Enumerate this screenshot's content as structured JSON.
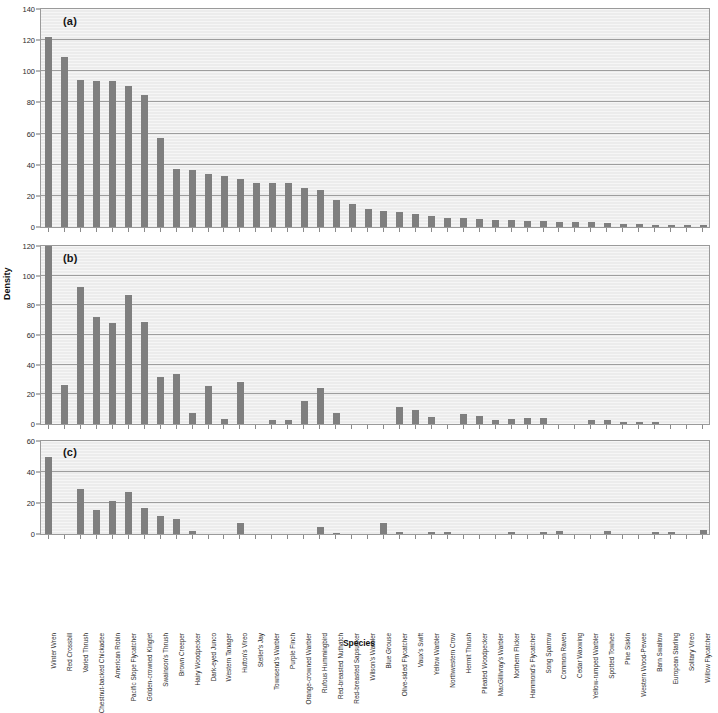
{
  "figure": {
    "ylabel": "Density",
    "xlabel": "Species",
    "bar_color": "#7f7f7f",
    "plot_bg_color": "#ececec",
    "grid_color": "#9d9d9d"
  },
  "panels": [
    {
      "tag": "(a)",
      "ymin": 0,
      "ymax": 140,
      "ystep": 20
    },
    {
      "tag": "(b)",
      "ymin": 0,
      "ymax": 120,
      "ystep": 20
    },
    {
      "tag": "(c)",
      "ymin": 0,
      "ymax": 60,
      "ystep": 20
    }
  ],
  "chart_data": {
    "type": "bar",
    "title": "",
    "xlabel": "Species",
    "ylabel": "Density",
    "grid": true,
    "legend": null,
    "panel_layout": "three stacked panels (a), (b), (c) sharing one Species axis",
    "categories": [
      "Winter Wren",
      "Red Crossbill",
      "Varied Thrush",
      "Chestnut-backed Chickadee",
      "American Robin",
      "Pacific Slope Flycatcher",
      "Golden-crowned Kinglet",
      "Swainson's Thrush",
      "Brown Creeper",
      "Hairy Woodpecker",
      "Dark-eyed Junco",
      "Western Tanager",
      "Hutton's Vireo",
      "Steller's Jay",
      "Townsend's Warbler",
      "Purple Finch",
      "Orange-crowned Warbler",
      "Rufous Hummingbird",
      "Red-breasted Nuthatch",
      "Red-breasted Sapsucker",
      "Wilson's Warbler",
      "Blue Grouse",
      "Olive-sided Flycatcher",
      "Vaux's Swift",
      "Yellow Warbler",
      "Northwestern Crow",
      "Hermit Thrush",
      "Pileated Woodpecker",
      "MacGillivray's Warbler",
      "Northern Flicker",
      "Hammond's Flycatcher",
      "Song Sparrow",
      "Common Raven",
      "Cedar Waxwing",
      "Yellow-rumped Warbler",
      "Spotted Towhee",
      "Pine Siskin",
      "Western Wood-Pewee",
      "Barn Swallow",
      "European Starling",
      "Solitary Vireo",
      "Willow Flycatcher"
    ],
    "panels": [
      {
        "tag": "(a)",
        "ylim": [
          0,
          140
        ],
        "yticks": [
          0,
          20,
          40,
          60,
          80,
          100,
          120,
          140
        ],
        "values": [
          122,
          109,
          94.5,
          93.5,
          94,
          90.5,
          84.5,
          57,
          37,
          36.5,
          34,
          33,
          31,
          28,
          28,
          28,
          25,
          24,
          17.5,
          14.5,
          11.5,
          10.5,
          9.5,
          8.5,
          7,
          6,
          5.5,
          5,
          4.5,
          4.5,
          4,
          4,
          3.5,
          3.5,
          3,
          2.5,
          2,
          2,
          1.5,
          1.5,
          1,
          1
        ]
      },
      {
        "tag": "(b)",
        "ylim": [
          0,
          120
        ],
        "yticks": [
          0,
          20,
          40,
          60,
          80,
          100,
          120
        ],
        "values": [
          120,
          26,
          92.5,
          72,
          68,
          87,
          68.5,
          31.5,
          33.5,
          7.5,
          25.5,
          3.5,
          28,
          0,
          3,
          2.8,
          15.5,
          24,
          7.5,
          0,
          0,
          0,
          11.5,
          9.5,
          5,
          0,
          6.5,
          5.5,
          2.5,
          3.5,
          4,
          4,
          0,
          0,
          3,
          3,
          1.5,
          1.5,
          1.5,
          0,
          0,
          0
        ]
      },
      {
        "tag": "(c)",
        "ylim": [
          0,
          60
        ],
        "yticks": [
          0,
          20,
          40,
          60
        ],
        "values": [
          50,
          0,
          29,
          15.5,
          21,
          27,
          16.5,
          11.5,
          10,
          2,
          0,
          0,
          7,
          0,
          0,
          0,
          0,
          4.5,
          0.8,
          0,
          0,
          7,
          1,
          0,
          1.5,
          1.5,
          0,
          0,
          0,
          1.5,
          0,
          1.5,
          2,
          0,
          0,
          2,
          0,
          0,
          1,
          1,
          0,
          2.5
        ]
      }
    ]
  }
}
